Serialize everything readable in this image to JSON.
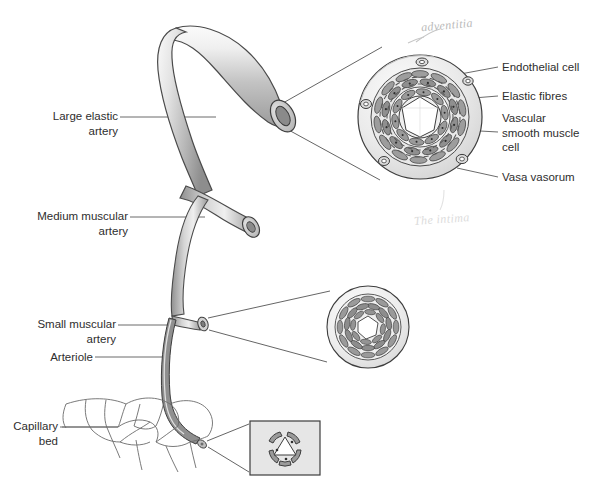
{
  "figure": {
    "background_color": "#ffffff",
    "width": 594,
    "height": 482
  },
  "colors": {
    "label_text": "#2e2e2e",
    "leader_line": "#5a5a5a",
    "vessel_outline": "#4a4a4a",
    "vessel_fill_light": "#f2f2f2",
    "vessel_fill_mid": "#c9c9c9",
    "vessel_fill_dark": "#8e8e8e",
    "lumen": "#ffffff",
    "wall_band": "#e3e3e3",
    "cell_fill": "#9a9a9a",
    "annotation_adventitia": "#b9b9b9",
    "annotation_intima": "#dcdcdc",
    "inset_box_fill": "#e6e6e6",
    "inset_box_border": "#4a4a4a"
  },
  "left_labels": [
    {
      "id": "large-elastic-artery",
      "text": "Large elastic\nartery"
    },
    {
      "id": "medium-muscular-artery",
      "text": "Medium muscular\nartery"
    },
    {
      "id": "small-muscular-artery",
      "text": "Small muscular\nartery"
    },
    {
      "id": "arteriole",
      "text": "Arteriole"
    },
    {
      "id": "capillary-bed",
      "text": "Capillary\nbed"
    }
  ],
  "right_labels": [
    {
      "id": "endothelial-cell",
      "text": "Endothelial cell"
    },
    {
      "id": "elastic-fibres",
      "text": "Elastic fibres"
    },
    {
      "id": "vascular-smooth-muscle-cell",
      "text": "Vascular\nsmooth muscle\ncell"
    },
    {
      "id": "vasa-vasorum",
      "text": "Vasa vasorum"
    }
  ],
  "handwritten_annotations": [
    {
      "id": "adventitia",
      "text": "adventitia"
    },
    {
      "id": "the-intima",
      "text": "The intima"
    }
  ],
  "cross_sections": [
    {
      "id": "large-elastic-artery-cross-section",
      "vessel": "Large elastic artery",
      "lumen_shape": "star",
      "has_vasa_vasorum": true,
      "cell_ring_count": 4
    },
    {
      "id": "small-muscular-artery-cross-section",
      "vessel": "Small muscular artery",
      "lumen_shape": "polygon",
      "has_vasa_vasorum": false,
      "cell_ring_count": 3
    },
    {
      "id": "arteriole-cross-section",
      "vessel": "Arteriole",
      "lumen_shape": "triangle",
      "has_vasa_vasorum": false,
      "cell_ring_count": 1,
      "framed": true
    }
  ]
}
